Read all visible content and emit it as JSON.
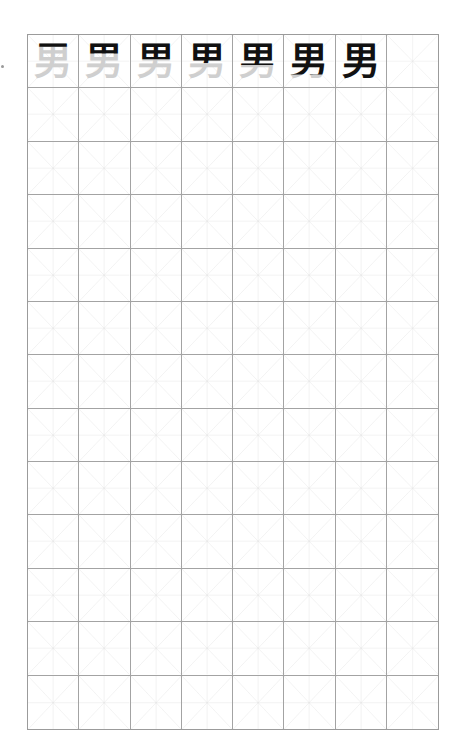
{
  "worksheet": {
    "character": "男",
    "columns": 8,
    "rows": 13,
    "grid_color": "#a3a3a3",
    "guide_color": "#e2e2e2",
    "trace_color": "#cfcfcf",
    "ink_color": "#111111",
    "stroke_progression": [
      {
        "cell": 1,
        "char": "男",
        "ink_fraction": 0.12
      },
      {
        "cell": 2,
        "char": "男",
        "ink_fraction": 0.3
      },
      {
        "cell": 3,
        "char": "男",
        "ink_fraction": 0.45
      },
      {
        "cell": 4,
        "char": "男",
        "ink_fraction": 0.55
      },
      {
        "cell": 5,
        "char": "男",
        "ink_fraction": 0.6
      },
      {
        "cell": 6,
        "char": "男",
        "ink_fraction": 0.85
      },
      {
        "cell": 7,
        "char": "男",
        "ink_fraction": 1.0
      }
    ]
  }
}
